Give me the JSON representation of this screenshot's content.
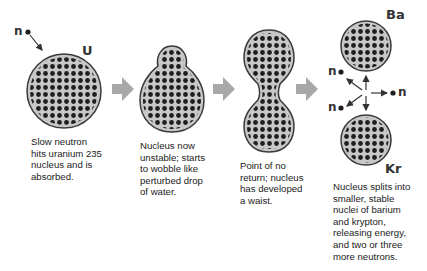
{
  "diagram": {
    "colors": {
      "nucleus_fill": "#c8c8c8",
      "nucleus_outline": "#3a3a3a",
      "nucleon_dot": "#1e1e1e",
      "step_arrow": "#a8a8a8",
      "text": "#222222"
    },
    "labels": {
      "neutron_incoming": "n",
      "uranium": "U",
      "barium": "Ba",
      "krypton": "Kr",
      "neutron_out_1": "n",
      "neutron_out_2": "n",
      "neutron_out_3": "n"
    },
    "steps": [
      {
        "id": "absorption",
        "shape": "sphere",
        "caption_lines": [
          "Slow neutron",
          "hits uranium 235",
          "nucleus and is",
          "absorbed."
        ]
      },
      {
        "id": "unstable",
        "shape": "wobbling-drop",
        "caption_lines": [
          "Nucleus now",
          "unstable; starts",
          "to wobble like",
          "perturbed drop",
          "of water."
        ]
      },
      {
        "id": "waist",
        "shape": "dumbbell",
        "caption_lines": [
          "Point of no",
          "return; nucleus",
          "has developed",
          "a waist."
        ]
      },
      {
        "id": "split",
        "shape": "two-spheres",
        "caption_lines": [
          "Nucleus splits into",
          "smaller, stable",
          "nuclei of barium",
          "and krypton,",
          "releasing energy,",
          "and two or three",
          "more neutrons."
        ]
      }
    ]
  }
}
